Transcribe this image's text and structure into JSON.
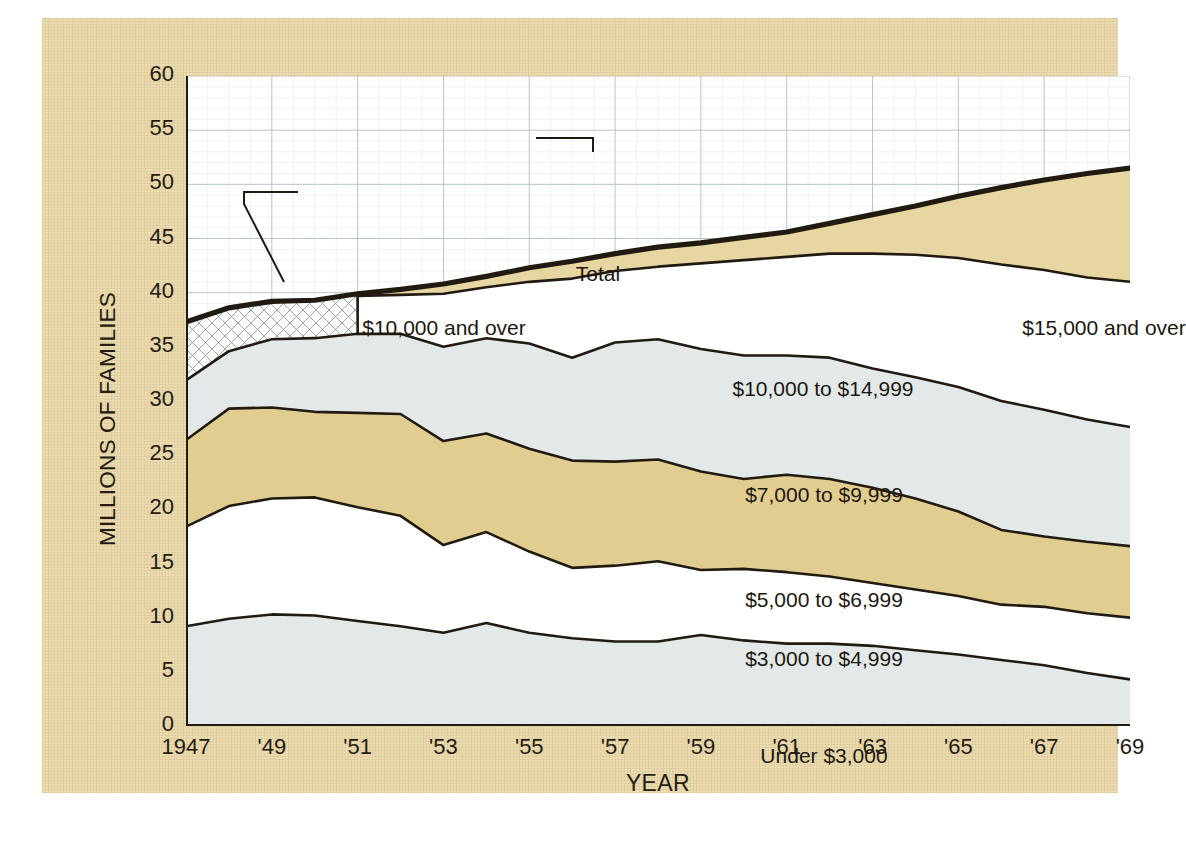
{
  "figure": {
    "corner_note": "",
    "ylabel": "MILLIONS OF FAMILIES",
    "xlabel": "YEAR"
  },
  "colors": {
    "poster_background": "#ecdcb0",
    "plot_background": "#ffffff",
    "band_tan": "#ecdcab",
    "band_grey": "#e3e8e8",
    "band_white": "#ffffff",
    "line": "#211a10",
    "grid": "#b9c4c9",
    "text": "#231c12"
  },
  "chart_data": {
    "type": "area",
    "title": "",
    "subtitle": "",
    "xlabel": "YEAR",
    "ylabel": "MILLIONS OF FAMILIES",
    "xlim": [
      1947,
      1969
    ],
    "ylim": [
      0,
      60
    ],
    "yticks": [
      0,
      5,
      10,
      15,
      20,
      25,
      30,
      35,
      40,
      45,
      50,
      55,
      60
    ],
    "ytick_labels": [
      "0",
      "5",
      "10",
      "15",
      "20",
      "25",
      "30",
      "35",
      "40",
      "45",
      "50",
      "55",
      "60"
    ],
    "xticks": [
      1947,
      1949,
      1951,
      1953,
      1955,
      1957,
      1959,
      1961,
      1963,
      1965,
      1967,
      1969
    ],
    "xtick_labels": [
      "1947",
      "'49",
      "'51",
      "'53",
      "'55",
      "'57",
      "'59",
      "'61",
      "'63",
      "'65",
      "'67",
      "'69"
    ],
    "grid": true,
    "minor_grid": true,
    "legend": "inline-band-labels",
    "stacked": true,
    "x": [
      1947,
      1948,
      1949,
      1950,
      1951,
      1952,
      1953,
      1954,
      1955,
      1956,
      1957,
      1958,
      1959,
      1960,
      1961,
      1962,
      1963,
      1964,
      1965,
      1966,
      1967,
      1968,
      1969
    ],
    "series": [
      {
        "name": "Under $3,000",
        "label": "Under $3,000",
        "fill": "#e3e8e8",
        "cumulative": [
          9.2,
          9.9,
          10.3,
          10.2,
          9.7,
          9.2,
          8.6,
          9.5,
          8.6,
          8.1,
          7.8,
          7.8,
          8.4,
          7.9,
          7.6,
          7.6,
          7.4,
          7.0,
          6.6,
          6.1,
          5.6,
          4.9,
          4.3
        ]
      },
      {
        "name": "$3,000 to $4,999",
        "label": "$3,000 to $4,999",
        "fill": "#ffffff",
        "cumulative": [
          18.4,
          20.3,
          21.0,
          21.1,
          20.2,
          19.4,
          16.7,
          17.9,
          16.1,
          14.6,
          14.8,
          15.2,
          14.4,
          14.5,
          14.2,
          13.8,
          13.2,
          12.6,
          12.0,
          11.2,
          11.0,
          10.4,
          10.0
        ]
      },
      {
        "name": "$5,000 to $6,999",
        "label": "$5,000 to $6,999",
        "fill": "#e2cd91",
        "cumulative": [
          26.4,
          29.3,
          29.4,
          29.0,
          28.9,
          28.8,
          26.3,
          27.0,
          25.6,
          24.5,
          24.4,
          24.6,
          23.5,
          22.8,
          23.2,
          22.8,
          22.0,
          21.0,
          19.8,
          18.1,
          17.5,
          17.0,
          16.6
        ]
      },
      {
        "name": "$7,000 to $9,999",
        "label": "$7,000 to $9,999",
        "fill": "#e3e8e8",
        "cumulative": [
          31.9,
          34.6,
          35.7,
          35.8,
          36.2,
          36.2,
          35.0,
          35.8,
          35.3,
          34.0,
          35.4,
          35.7,
          34.8,
          34.2,
          34.2,
          34.0,
          33.0,
          32.2,
          31.3,
          30.0,
          29.2,
          28.3,
          27.6
        ]
      },
      {
        "name": "$10,000 to $14,999",
        "label": "$10,000 to $14,999",
        "fill": "#ffffff",
        "cumulative": [
          null,
          null,
          null,
          null,
          39.7,
          39.8,
          39.9,
          40.5,
          41.0,
          41.3,
          42.0,
          42.4,
          42.7,
          43.0,
          43.3,
          43.6,
          43.6,
          43.5,
          43.2,
          42.6,
          42.1,
          41.4,
          41.0
        ]
      },
      {
        "name": "$15,000 and over",
        "label": "$15,000 and over",
        "fill": "#e8d6a2",
        "cumulative": [
          null,
          null,
          null,
          null,
          39.9,
          40.3,
          40.8,
          41.5,
          42.3,
          42.9,
          43.6,
          44.2,
          44.6,
          45.1,
          45.6,
          46.4,
          47.2,
          48.0,
          48.9,
          49.7,
          50.4,
          51.0,
          51.5
        ]
      }
    ],
    "total_line": {
      "name": "Total",
      "label": "Total",
      "values": [
        37.3,
        38.6,
        39.2,
        39.3,
        39.9,
        40.3,
        40.8,
        41.5,
        42.3,
        42.9,
        43.6,
        44.2,
        44.6,
        45.1,
        45.6,
        46.4,
        47.2,
        48.0,
        48.9,
        49.7,
        50.4,
        51.0,
        51.5
      ]
    },
    "hatched_region": {
      "name": "$10,000 and over",
      "label": "$10,000 and over",
      "x_from": 1947,
      "x_to": 1951,
      "pattern": "cross-hatch"
    },
    "annotations": [
      {
        "text": "Total",
        "x_px": 412,
        "y_px": 186,
        "leader": true
      },
      {
        "text": "$10,000 and over",
        "x_px": 258,
        "y_px": 240,
        "leader": true
      },
      {
        "text": "$15,000 and over",
        "x_px": 918,
        "y_px": 240,
        "leader": false
      },
      {
        "text": "$10,000 to $14,999",
        "x_px": 637,
        "y_px": 301,
        "leader": false
      },
      {
        "text": "$7,000 to $9,999",
        "x_px": 638,
        "y_px": 407,
        "leader": false
      },
      {
        "text": "$5,000 to $6,999",
        "x_px": 638,
        "y_px": 512,
        "leader": false
      },
      {
        "text": "$3,000 to $4,999",
        "x_px": 638,
        "y_px": 571,
        "leader": false
      },
      {
        "text": "Under $3,000",
        "x_px": 638,
        "y_px": 668,
        "leader": false
      }
    ]
  }
}
